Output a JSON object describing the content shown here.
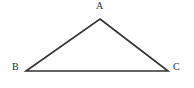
{
  "figure": {
    "type": "triangle-diagram",
    "background_color": "#ffffff",
    "stroke_color": "#333333",
    "stroke_width": 1.6,
    "label_color": "#2b2b2b",
    "canvas": {
      "width": 194,
      "height": 88
    },
    "vertices": [
      {
        "id": "A",
        "label": "A",
        "x": 100,
        "y": 19,
        "label_x": 96,
        "label_y": 1,
        "position": "apex"
      },
      {
        "id": "B",
        "label": "B",
        "x": 26,
        "y": 71,
        "label_x": 12,
        "label_y": 62,
        "position": "bottom-left"
      },
      {
        "id": "C",
        "label": "C",
        "x": 168,
        "y": 71,
        "label_x": 173,
        "label_y": 62,
        "position": "bottom-right"
      }
    ],
    "edges": [
      {
        "id": "AB",
        "from": "A",
        "to": "B"
      },
      {
        "id": "AC",
        "from": "A",
        "to": "C"
      },
      {
        "id": "BC",
        "from": "B",
        "to": "C"
      }
    ]
  }
}
